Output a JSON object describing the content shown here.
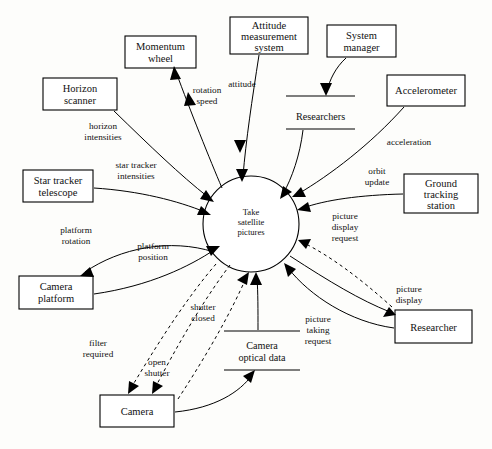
{
  "diagram": {
    "type": "data-flow-diagram",
    "title": "Take satellite pictures",
    "notation": {
      "solid_arrow": "data flow",
      "dashed_arrow": "control flow",
      "rectangle": "external entity / terminator",
      "circle": "process",
      "parallel_lines": "data store"
    },
    "process": {
      "id": "take-satellite-pictures",
      "label_line1": "Take",
      "label_line2": "satellite",
      "label_line3": "pictures",
      "cx": 251,
      "cy": 224,
      "r": 48
    },
    "entities": [
      {
        "id": "momentum-wheel",
        "line1": "Momentum",
        "line2": "wheel",
        "x": 125,
        "y": 36,
        "w": 71,
        "h": 32
      },
      {
        "id": "horizon-scanner",
        "line1": "Horizon",
        "line2": "scanner",
        "x": 43,
        "y": 78,
        "w": 74,
        "h": 32
      },
      {
        "id": "attitude-measurement-system",
        "line1": "Attitude",
        "line2": "measurement",
        "line3": "system",
        "x": 230,
        "y": 17,
        "w": 78,
        "h": 37
      },
      {
        "id": "system-manager",
        "line1": "System",
        "line2": "manager",
        "x": 327,
        "y": 25,
        "w": 69,
        "h": 32
      },
      {
        "id": "accelerometer",
        "line1": "Accelerometer",
        "x": 387,
        "y": 75,
        "w": 78,
        "h": 31
      },
      {
        "id": "ground-tracking-station",
        "line1": "Ground",
        "line2": "tracking",
        "line3": "station",
        "x": 404,
        "y": 174,
        "w": 74,
        "h": 39
      },
      {
        "id": "star-tracker-telescope",
        "line1": "Star tracker",
        "line2": "telescope",
        "x": 23,
        "y": 170,
        "w": 70,
        "h": 32
      },
      {
        "id": "camera-platform",
        "line1": "Camera",
        "line2": "platform",
        "x": 19,
        "y": 276,
        "w": 74,
        "h": 33
      },
      {
        "id": "camera",
        "line1": "Camera",
        "x": 100,
        "y": 395,
        "w": 74,
        "h": 32
      },
      {
        "id": "researcher",
        "line1": "Researcher",
        "x": 395,
        "y": 310,
        "w": 77,
        "h": 33
      }
    ],
    "stores": [
      {
        "id": "researchers-store",
        "label": "Researchers",
        "x1": 286,
        "x2": 355,
        "y_top": 96,
        "y_bottom": 129,
        "label_y": 117
      },
      {
        "id": "camera-optical-data-store",
        "line1": "Camera",
        "line2": "optical data",
        "x1": 224,
        "x2": 300,
        "y_top": 331,
        "y_bottom": 370,
        "label_y": 348
      }
    ],
    "flows": [
      {
        "id": "rotation-speed",
        "line1": "rotation",
        "line2": "speed",
        "kind": "data",
        "label_x": 207,
        "label_y": 96,
        "direction": "process-to-momentum-wheel"
      },
      {
        "id": "horizon-intensities",
        "line1": "horizon",
        "line2": "intensities",
        "kind": "data",
        "label_x": 103,
        "label_y": 131,
        "direction": "horizon-scanner-to-process"
      },
      {
        "id": "attitude",
        "line1": "attitude",
        "kind": "data",
        "label_x": 243,
        "label_y": 86,
        "direction": "attitude-measurement-system-to-process"
      },
      {
        "id": "acceleration",
        "line1": "acceleration",
        "kind": "data",
        "label_x": 409,
        "label_y": 143,
        "direction": "accelerometer-to-process"
      },
      {
        "id": "orbit-update",
        "line1": "orbit",
        "line2": "update",
        "kind": "data",
        "label_x": 377,
        "label_y": 176,
        "direction": "ground-tracking-station-to-process"
      },
      {
        "id": "star-tracker-intensities",
        "line1": "star tracker",
        "line2": "intensities",
        "kind": "data",
        "label_x": 136,
        "label_y": 170,
        "direction": "star-tracker-telescope-to-process"
      },
      {
        "id": "platform-rotation",
        "line1": "platform",
        "line2": "rotation",
        "kind": "data",
        "label_x": 76,
        "label_y": 235,
        "direction": "process-to-camera-platform"
      },
      {
        "id": "platform-position",
        "line1": "platform",
        "line2": "position",
        "kind": "data",
        "label_x": 153,
        "label_y": 251,
        "direction": "camera-platform-to-process"
      },
      {
        "id": "picture-display-request",
        "line1": "picture",
        "line2": "display",
        "line3": "request",
        "kind": "control",
        "label_x": 345,
        "label_y": 225,
        "direction": "researcher-to-process"
      },
      {
        "id": "picture-display",
        "line1": "picture",
        "line2": "display",
        "kind": "data",
        "label_x": 409,
        "label_y": 296,
        "direction": "process-to-researcher"
      },
      {
        "id": "picture-taking-request",
        "line1": "picture",
        "line2": "taking",
        "line3": "request",
        "kind": "data",
        "label_x": 318,
        "label_y": 327,
        "direction": "researcher-to-process"
      },
      {
        "id": "shutter-closed",
        "line1": "shutter",
        "line2": "closed",
        "kind": "control",
        "label_x": 203,
        "label_y": 312,
        "direction": "camera-to-process"
      },
      {
        "id": "open-shutter",
        "line1": "open",
        "line2": "shutter",
        "kind": "control",
        "label_x": 155,
        "label_y": 367,
        "direction": "process-to-camera"
      },
      {
        "id": "filter-required",
        "line1": "filter",
        "line2": "required",
        "kind": "control",
        "label_x": 98,
        "label_y": 348,
        "direction": "process-to-camera"
      }
    ]
  }
}
